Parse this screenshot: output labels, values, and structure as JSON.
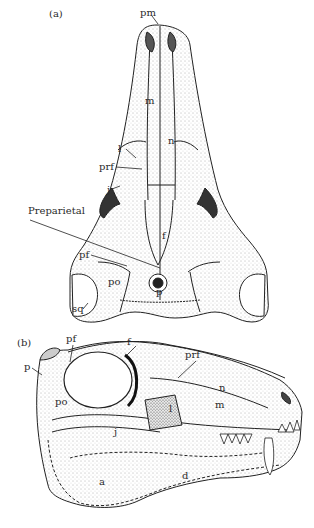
{
  "figure": {
    "panels": [
      {
        "id": "a",
        "label": "(a)",
        "view": "dorsal",
        "labels": [
          {
            "text": "pm",
            "x": 140,
            "y": 8
          },
          {
            "text": "m",
            "x": 145,
            "y": 96
          },
          {
            "text": "n",
            "x": 168,
            "y": 136
          },
          {
            "text": "l",
            "x": 118,
            "y": 144
          },
          {
            "text": "prf",
            "x": 99,
            "y": 162
          },
          {
            "text": "j",
            "x": 107,
            "y": 185
          },
          {
            "text": "Preparietal",
            "x": 28,
            "y": 206
          },
          {
            "text": "f",
            "x": 162,
            "y": 231
          },
          {
            "text": "pf",
            "x": 79,
            "y": 250
          },
          {
            "text": "po",
            "x": 108,
            "y": 277
          },
          {
            "text": "p",
            "x": 156,
            "y": 287
          },
          {
            "text": "sq",
            "x": 72,
            "y": 304
          }
        ]
      },
      {
        "id": "b",
        "label": "(b)",
        "view": "lateral",
        "labels": [
          {
            "text": "pf",
            "x": 66,
            "y": 334
          },
          {
            "text": "f",
            "x": 127,
            "y": 337
          },
          {
            "text": "p",
            "x": 24,
            "y": 362
          },
          {
            "text": "po",
            "x": 55,
            "y": 397
          },
          {
            "text": "prf",
            "x": 185,
            "y": 350
          },
          {
            "text": "n",
            "x": 219,
            "y": 383
          },
          {
            "text": "m",
            "x": 215,
            "y": 400
          },
          {
            "text": "l",
            "x": 169,
            "y": 404
          },
          {
            "text": "j",
            "x": 114,
            "y": 427
          },
          {
            "text": "a",
            "x": 99,
            "y": 477
          },
          {
            "text": "d",
            "x": 182,
            "y": 471
          }
        ]
      }
    ],
    "colors": {
      "line": "#222222",
      "stipple": "#555555",
      "background": "#ffffff"
    }
  }
}
